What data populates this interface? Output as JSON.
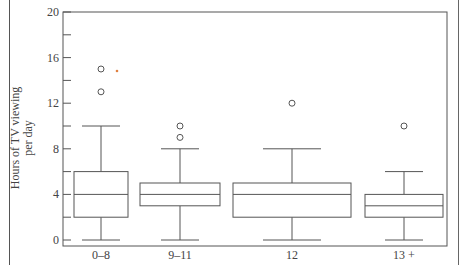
{
  "chart_data": {
    "type": "box",
    "title": "",
    "xlabel": "",
    "ylabel": "Hours of TV viewing per day",
    "ylabel_lines": [
      "Hours of TV viewing",
      "per day"
    ],
    "ylim": [
      0,
      20
    ],
    "yticks_labeled": [
      0,
      4,
      8,
      12,
      16,
      20
    ],
    "yticks_minor": [
      2,
      6,
      10,
      14,
      18
    ],
    "grid": false,
    "categories": [
      "0–8",
      "9–11",
      "12",
      "13 +"
    ],
    "boxes": [
      {
        "category": "0–8",
        "whisker_low": 0,
        "q1": 2,
        "median": 4,
        "q3": 6,
        "whisker_high": 10,
        "outliers": [
          13,
          15
        ]
      },
      {
        "category": "9–11",
        "whisker_low": 0,
        "q1": 3,
        "median": 4,
        "q3": 5,
        "whisker_high": 8,
        "outliers": [
          9,
          10
        ]
      },
      {
        "category": "12",
        "whisker_low": 0,
        "q1": 2,
        "median": 4,
        "q3": 5,
        "whisker_high": 8,
        "outliers": [
          12
        ]
      },
      {
        "category": "13 +",
        "whisker_low": 0,
        "q1": 2,
        "median": 3,
        "q3": 4,
        "whisker_high": 6,
        "outliers": [
          10
        ]
      }
    ]
  },
  "axis": {
    "ylabel_line1": "Hours of TV viewing",
    "ylabel_line2": "per day",
    "ytick_labels": [
      "0",
      "4",
      "8",
      "12",
      "16",
      "20"
    ],
    "xtick_labels": [
      "0–8",
      "9–11",
      "12",
      "13 +"
    ]
  }
}
